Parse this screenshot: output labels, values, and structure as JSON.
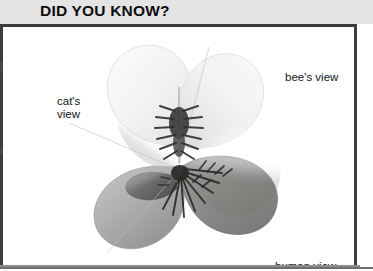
{
  "panel": {
    "title": "DID YOU KNOW?",
    "background_color": "#ffffff",
    "header_background_color": "#e4e4e4",
    "border_color": "#3d3d3d"
  },
  "illustration": {
    "subject": "pansy-flower",
    "description": "Grayscale pansy flower divided into wedge sectors comparing how different creatures see the same bloom",
    "center_feature": "dark radiating nectar guide lines",
    "labels": [
      {
        "id": "bees-view",
        "text": "bee's view",
        "position": "upper-right"
      },
      {
        "id": "cats-view",
        "text": "cat's\nview",
        "position": "upper-left"
      },
      {
        "id": "human-view",
        "text": "human view",
        "position": "lower-right"
      }
    ],
    "petals": [
      {
        "id": "petal-upper-left",
        "tone": "very-pale",
        "color": "#f2f2f0"
      },
      {
        "id": "petal-upper-right",
        "tone": "very-pale",
        "color": "#efefed"
      },
      {
        "id": "petal-lower-left",
        "tone": "mid-gray",
        "color": "#a9a9a7"
      },
      {
        "id": "petal-lower-right",
        "tone": "dark-gray",
        "color": "#8e8e8c"
      },
      {
        "id": "petal-center-left",
        "tone": "dark-gray",
        "color": "#6d6d6b"
      }
    ]
  }
}
